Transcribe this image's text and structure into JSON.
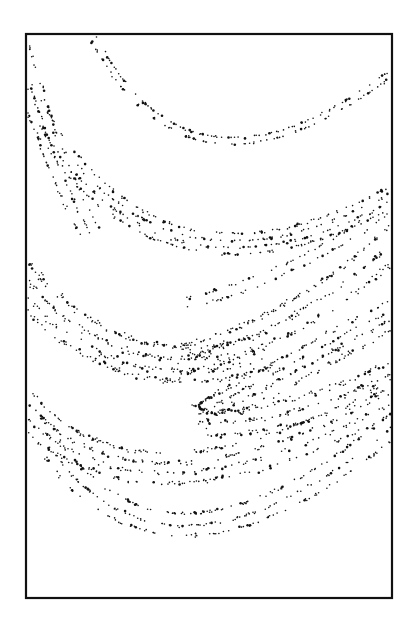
{
  "chart_data": {
    "type": "scatter",
    "title": "",
    "xlabel": "",
    "ylabel": "",
    "x_ticks": [],
    "y_ticks": [],
    "grid": false,
    "legend": null,
    "frame": {
      "x1": 26,
      "y1": 34,
      "x2": 392,
      "y2": 598,
      "stroke": "#111111"
    },
    "dot_color": "#111111",
    "seed": 1234,
    "bands": [
      {
        "name": "top-band-outer",
        "p0": [
          96,
          36
        ],
        "c": [
          190,
          220
        ],
        "p1": [
          388,
          72
        ],
        "strands": [
          0,
          6
        ],
        "spread": 1.6,
        "points": 170
      },
      {
        "name": "left-edge-bands",
        "p0": [
          28,
          40
        ],
        "c": [
          60,
          160
        ],
        "p1": [
          100,
          230
        ],
        "strands": [
          0,
          10,
          20
        ],
        "spread": 2.2,
        "points": 150
      },
      {
        "name": "second-band",
        "p0": [
          30,
          80
        ],
        "c": [
          150,
          320
        ],
        "p1": [
          390,
          186
        ],
        "strands": [
          0,
          7,
          14,
          20
        ],
        "spread": 2.0,
        "points": 360
      },
      {
        "name": "third-band-right",
        "p0": [
          180,
          300
        ],
        "c": [
          300,
          270
        ],
        "p1": [
          390,
          200
        ],
        "strands": [
          0,
          10
        ],
        "spread": 2.5,
        "points": 90
      },
      {
        "name": "middle-cloud-left",
        "p0": [
          28,
          262
        ],
        "c": [
          120,
          380
        ],
        "p1": [
          260,
          335
        ],
        "strands": [
          0,
          12,
          24,
          34
        ],
        "spread": 5.0,
        "points": 380
      },
      {
        "name": "middle-cloud-right",
        "p0": [
          180,
          345
        ],
        "c": [
          290,
          320
        ],
        "p1": [
          392,
          225
        ],
        "strands": [
          0,
          14,
          28
        ],
        "spread": 5.0,
        "points": 260
      },
      {
        "name": "fold-upper-arm",
        "p0": [
          190,
          408
        ],
        "c": [
          280,
          360
        ],
        "p1": [
          392,
          298
        ],
        "strands": [
          0,
          9,
          18,
          28
        ],
        "spread": 3.5,
        "points": 260
      },
      {
        "name": "fold-tip",
        "p0": [
          215,
          396
        ],
        "c": [
          180,
          408
        ],
        "p1": [
          220,
          414
        ],
        "strands": [
          0
        ],
        "spread": 1.2,
        "points": 40
      },
      {
        "name": "fold-lower-arm",
        "p0": [
          200,
          412
        ],
        "c": [
          300,
          410
        ],
        "p1": [
          392,
          360
        ],
        "strands": [
          0,
          12,
          24
        ],
        "spread": 4.0,
        "points": 200
      },
      {
        "name": "lower-band-1",
        "p0": [
          30,
          392
        ],
        "c": [
          140,
          520
        ],
        "p1": [
          392,
          380
        ],
        "strands": [
          0,
          10,
          20,
          30
        ],
        "spread": 3.5,
        "points": 420
      },
      {
        "name": "lower-band-2",
        "p0": [
          60,
          440
        ],
        "c": [
          170,
          600
        ],
        "p1": [
          392,
          412
        ],
        "strands": [
          0,
          12,
          22
        ],
        "spread": 2.5,
        "points": 300
      }
    ]
  }
}
